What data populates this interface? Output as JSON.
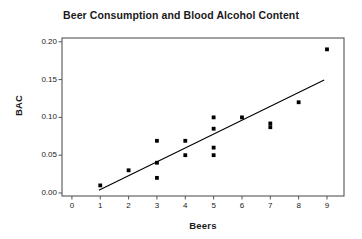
{
  "chart_data": {
    "type": "scatter",
    "title": "Beer Consumption and Blood Alcohol Content",
    "xlabel": "Beers",
    "ylabel": "BAC",
    "xlim": [
      -0.35,
      9.6
    ],
    "ylim": [
      -0.004,
      0.205
    ],
    "grid": false,
    "legend": null,
    "xticks": [
      0,
      1,
      2,
      3,
      4,
      5,
      6,
      7,
      8,
      9
    ],
    "xtick_labels": [
      "0",
      "1",
      "2",
      "3",
      "4",
      "5",
      "6",
      "7",
      "8",
      "9"
    ],
    "yticks": [
      0.0,
      0.05,
      0.1,
      0.15,
      0.2
    ],
    "ytick_labels": [
      "0.00",
      "0.05",
      "0.10",
      "0.15",
      "0.20"
    ],
    "marker": "filled-square-dot",
    "marker_color": "#000000",
    "points": [
      {
        "x": 1,
        "y": 0.01
      },
      {
        "x": 2,
        "y": 0.03
      },
      {
        "x": 3,
        "y": 0.069
      },
      {
        "x": 3,
        "y": 0.04
      },
      {
        "x": 3,
        "y": 0.02
      },
      {
        "x": 4,
        "y": 0.069
      },
      {
        "x": 4,
        "y": 0.05
      },
      {
        "x": 5,
        "y": 0.1
      },
      {
        "x": 5,
        "y": 0.085
      },
      {
        "x": 5,
        "y": 0.06
      },
      {
        "x": 5,
        "y": 0.05
      },
      {
        "x": 6,
        "y": 0.1
      },
      {
        "x": 7,
        "y": 0.092
      },
      {
        "x": 7,
        "y": 0.087
      },
      {
        "x": 8,
        "y": 0.12
      },
      {
        "x": 9,
        "y": 0.19
      }
    ],
    "fit_line": {
      "name": "least-squares regression line",
      "color": "#000000",
      "x_start": 0.95,
      "y_start": 0.0035,
      "x_end": 8.9,
      "y_end": 0.1495
    },
    "axes_style": {
      "frame": "full-box",
      "frame_color": "#555555",
      "tick_color": "#555555"
    }
  }
}
